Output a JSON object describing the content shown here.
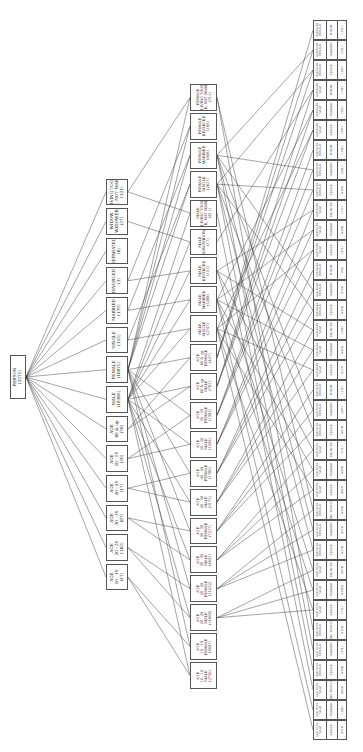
{
  "diagram": {
    "root": {
      "id": "root",
      "lines": [
        "PERSON",
        "(3271)"
      ]
    },
    "level1": [
      {
        "id": "a1519",
        "lines": [
          "AGE",
          "10 - 19",
          "(47)"
        ]
      },
      {
        "id": "a2029",
        "lines": [
          "AGE",
          "20 - 29",
          "(162)"
        ]
      },
      {
        "id": "a3039",
        "lines": [
          "AGE",
          "30 - 39",
          "(87)"
        ]
      },
      {
        "id": "a4049",
        "lines": [
          "AGE",
          "40 - 49",
          "(17)"
        ]
      },
      {
        "id": "a5059",
        "lines": [
          "AGE",
          "50 - 59",
          "(30)"
        ]
      },
      {
        "id": "a60up",
        "lines": [
          "AGE",
          "60 & up",
          "(76)"
        ]
      },
      {
        "id": "male",
        "lines": [
          "MALE",
          "(18369)"
        ]
      },
      {
        "id": "female",
        "lines": [
          "FEMALE",
          "(16875)"
        ]
      },
      {
        "id": "single",
        "lines": [
          "SINGLE",
          "(115)"
        ]
      },
      {
        "id": "married",
        "lines": [
          "MARRIED",
          "(179)"
        ]
      },
      {
        "id": "divorced",
        "lines": [
          "DIVORCED",
          "(3)"
        ]
      },
      {
        "id": "separated",
        "lines": [
          "SEPARATED",
          "(6)"
        ]
      },
      {
        "id": "widow",
        "lines": [
          "WIDOW",
          "WIDOWER",
          "(37)"
        ]
      },
      {
        "id": "living",
        "lines": [
          "LIVING TOGE",
          "THER, NOT MARRIED",
          "(121)"
        ]
      }
    ],
    "level2": [
      {
        "id": "m1519",
        "lines": [
          "AGE",
          "10 - 19",
          "MALE",
          "(2730)"
        ]
      },
      {
        "id": "f1519",
        "lines": [
          "AGE",
          "10 - 19",
          "FEMALE",
          "(8097)"
        ]
      },
      {
        "id": "m2029",
        "lines": [
          "AGE",
          "20 - 29",
          "MALE",
          "(14908)"
        ]
      },
      {
        "id": "f2029",
        "lines": [
          "AGE",
          "20 - 29",
          "FEMALE",
          "(14432)"
        ]
      },
      {
        "id": "m3039",
        "lines": [
          "AGE",
          "30 - 39",
          "MALE",
          "(6035)"
        ]
      },
      {
        "id": "f3039",
        "lines": [
          "AGE",
          "30 - 39",
          "FEMALE",
          "(7217)"
        ]
      },
      {
        "id": "m4049",
        "lines": [
          "AGE",
          "40 - 49",
          "MALE",
          "(3175)"
        ]
      },
      {
        "id": "f4049",
        "lines": [
          "AGE",
          "40 - 49",
          "FEMALE",
          "(1780)"
        ]
      },
      {
        "id": "m5059",
        "lines": [
          "AGE",
          "50 - 59",
          "MALE",
          "(1209)"
        ]
      },
      {
        "id": "f5059",
        "lines": [
          "AGE",
          "50 - 59",
          "FEMALE",
          "(1382)"
        ]
      },
      {
        "id": "m60",
        "lines": [
          "AGE",
          "60 & up",
          "MALE",
          "(785)"
        ]
      },
      {
        "id": "f60",
        "lines": [
          "AGE",
          "60 & up",
          "FEMALE",
          "(447)"
        ]
      },
      {
        "id": "msingle",
        "lines": [
          "MALE",
          "SINGLE",
          "(2747)"
        ]
      },
      {
        "id": "mmarried",
        "lines": [
          "MALE",
          "MARRIED",
          "(1288)"
        ]
      },
      {
        "id": "mdivorced",
        "lines": [
          "MALE",
          "DIVORCED",
          "(131)"
        ]
      },
      {
        "id": "mwidow",
        "lines": [
          "MALE",
          "WIDOW/WIDOWER",
          "(17)"
        ]
      },
      {
        "id": "mliving",
        "lines": [
          "MALE",
          "LIVING TOGE",
          "THER, NOT MARRIED",
          "(611)"
        ]
      },
      {
        "id": "fsingle",
        "lines": [
          "FEMALE",
          "SINGLE",
          "(2657)"
        ]
      },
      {
        "id": "fmarried",
        "lines": [
          "FEMALE",
          "MARRIED",
          "(908)"
        ]
      },
      {
        "id": "fdivorced",
        "lines": [
          "FEMALE",
          "DIVORCED",
          "(189)"
        ]
      },
      {
        "id": "fliving",
        "lines": [
          "FEMALE",
          "LIVING TOGE",
          "THER, NOT MARRIED",
          "(315)"
        ]
      }
    ],
    "leaf_count": 36,
    "leaf_template": {
      "ages": [
        "10-19",
        "20-29",
        "30-39",
        "40-49",
        "50-59",
        "60 & up"
      ],
      "sexes": [
        "MALE",
        "FEMALE"
      ],
      "statuses": [
        "SINGLE",
        "MARRIED",
        "WIDOW",
        "LIVING"
      ]
    },
    "leaves": [
      {
        "age": "AGE 10-19",
        "sex": "MALE",
        "status": "SINGLE",
        "count": "(2713)"
      },
      {
        "age": "AGE 10-19",
        "sex": "MALE",
        "status": "MARRIED",
        "count": "(188)"
      },
      {
        "age": "AGE 10-19",
        "sex": "MALE",
        "status": "LIVING TOGE-THER",
        "count": "(2021)"
      },
      {
        "age": "AGE 10-19",
        "sex": "FEMALE",
        "status": "SINGLE",
        "count": "(1354)"
      },
      {
        "age": "AGE 10-19",
        "sex": "FEMALE",
        "status": "MARRIED",
        "count": "(274)"
      },
      {
        "age": "AGE 10-19",
        "sex": "FEMALE",
        "status": "LIVING TOGE-THER",
        "count": "(2116)"
      },
      {
        "age": "AGE 20-29",
        "sex": "MALE",
        "status": "SINGLE",
        "count": "(712)"
      },
      {
        "age": "AGE 20-29",
        "sex": "MALE",
        "status": "MARRIED",
        "count": "(22003)"
      },
      {
        "age": "AGE 20-29",
        "sex": "MALE",
        "status": "DIVORCED",
        "count": "(1870)"
      },
      {
        "age": "AGE 20-29",
        "sex": "FEMALE",
        "status": "SINGLE",
        "count": "(1379)"
      },
      {
        "age": "AGE 20-29",
        "sex": "FEMALE",
        "status": "MARRIED",
        "count": "(1271)"
      },
      {
        "age": "AGE 20-29",
        "sex": "FEMALE",
        "status": "LIVING TOGE-THER",
        "count": "(1203)"
      },
      {
        "age": "AGE 30-39",
        "sex": "MALE",
        "status": "SINGLE",
        "count": "(3427)"
      },
      {
        "age": "AGE 30-39",
        "sex": "MALE",
        "status": "MARRIED",
        "count": "(1085)"
      },
      {
        "age": "AGE 30-39",
        "sex": "MALE",
        "status": "DIVORCED",
        "count": "(511)"
      },
      {
        "age": "AGE 30-39",
        "sex": "FEMALE",
        "status": "SINGLE",
        "count": "(1070)"
      },
      {
        "age": "AGE 30-39",
        "sex": "FEMALE",
        "status": "MARRIED",
        "count": "(887)"
      },
      {
        "age": "AGE 30-39",
        "sex": "FEMALE",
        "status": "WIDOW",
        "count": "(213)"
      },
      {
        "age": "AGE 40-49",
        "sex": "MALE",
        "status": "SINGLE",
        "count": "(1177)"
      },
      {
        "age": "AGE 40-49",
        "sex": "MALE",
        "status": "MARRIED",
        "count": "(1422)"
      },
      {
        "age": "AGE 40-49",
        "sex": "MALE",
        "status": "DIVORCED",
        "count": "(109)"
      },
      {
        "age": "AGE 40-49",
        "sex": "FEMALE",
        "status": "SINGLE",
        "count": "(1316)"
      },
      {
        "age": "AGE 40-49",
        "sex": "FEMALE",
        "status": "MARRIED",
        "count": "(1131)"
      },
      {
        "age": "AGE 40-49",
        "sex": "FEMALE",
        "status": "WIDOW",
        "count": "(94)"
      },
      {
        "age": "AGE 50-59",
        "sex": "MALE",
        "status": "SINGLE",
        "count": "(472)"
      },
      {
        "age": "AGE 50-59",
        "sex": "MALE",
        "status": "MARRIED",
        "count": "(1288)"
      },
      {
        "age": "AGE 50-59",
        "sex": "MALE",
        "status": "DIVORCED",
        "count": "(117)"
      },
      {
        "age": "AGE 50-59",
        "sex": "FEMALE",
        "status": "SINGLE",
        "count": "(1161)"
      },
      {
        "age": "AGE 50-59",
        "sex": "FEMALE",
        "status": "MARRIED",
        "count": "(841)"
      },
      {
        "age": "AGE 50-59",
        "sex": "FEMALE",
        "status": "WIDOW",
        "count": "(149)"
      },
      {
        "age": "AGE 60-69",
        "sex": "MALE",
        "status": "SINGLE",
        "count": "(347)"
      },
      {
        "age": "AGE 60-69",
        "sex": "MALE",
        "status": "MARRIED",
        "count": "(581)"
      },
      {
        "age": "AGE 60-69",
        "sex": "MALE",
        "status": "WIDOW",
        "count": "(136)"
      },
      {
        "age": "AGE 60-69",
        "sex": "FEMALE",
        "status": "SINGLE",
        "count": "(247)"
      },
      {
        "age": "AGE 60-69",
        "sex": "FEMALE",
        "status": "MARRIED",
        "count": "(231)"
      },
      {
        "age": "AGE 60-69",
        "sex": "FEMALE",
        "status": "WIDOW",
        "count": "(151)"
      }
    ],
    "colors": {
      "line": "#333333",
      "border": "#555555",
      "background": "#ffffff"
    }
  }
}
